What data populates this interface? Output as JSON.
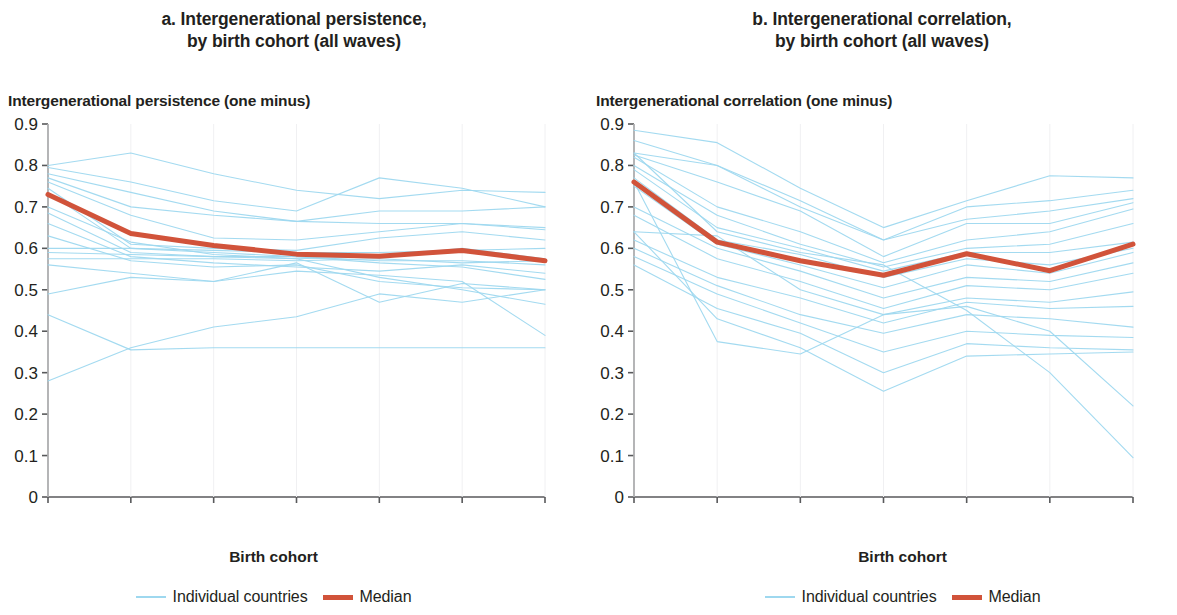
{
  "panels": [
    {
      "key": "a",
      "title": "a. Intergenerational persistence,\nby birth cohort (all waves)",
      "ylabel": "Intergenerational persistence (one minus)",
      "xlabel": "Birth cohort",
      "legend": {
        "individual_label": "Individual countries",
        "median_label": "Median"
      }
    },
    {
      "key": "b",
      "title": "b. Intergenerational correlation,\nby birth cohort (all waves)",
      "ylabel": "Intergenerational correlation (one minus)",
      "xlabel": "Birth cohort",
      "legend": {
        "individual_label": "Individual countries",
        "median_label": "Median"
      }
    }
  ],
  "colors": {
    "individual": "#9ed8ef",
    "median": "#d1533a",
    "axis": "#58595b",
    "text": "#231f20"
  },
  "chart_data": [
    {
      "type": "line",
      "panel": "a",
      "title": "a. Intergenerational persistence, by birth cohort (all waves)",
      "xlabel": "Birth cohort",
      "ylabel": "Intergenerational persistence (one minus)",
      "categories": [
        "1930–39",
        "1940–49",
        "1950–59",
        "1960–69",
        "1970–79",
        "1980–89",
        "1990–99"
      ],
      "yticks": [
        0,
        0.1,
        0.2,
        0.3,
        0.4,
        0.5,
        0.6,
        0.7,
        0.8,
        0.9
      ],
      "ytick_labels": [
        "0",
        "0.1",
        "0.2",
        "0.3",
        "0.4",
        "0.5",
        "0.6",
        "0.7",
        "0.8",
        "0.9"
      ],
      "ylim": [
        0,
        0.9
      ],
      "grid": false,
      "legend_position": "bottom",
      "series": [
        {
          "name": "Median",
          "emphasis": true,
          "color": "#d1533a",
          "values": [
            0.73,
            0.636,
            0.607,
            0.586,
            0.581,
            0.595,
            0.57,
            0.615
          ]
        },
        {
          "name": "Country 1",
          "color": "#9ed8ef",
          "values": [
            0.8,
            0.83,
            0.78,
            0.74,
            0.72,
            0.74,
            0.735,
            0.75
          ]
        },
        {
          "name": "Country 2",
          "color": "#9ed8ef",
          "values": [
            0.795,
            0.76,
            0.715,
            0.69,
            0.77,
            0.745,
            0.7,
            0.76
          ]
        },
        {
          "name": "Country 3",
          "color": "#9ed8ef",
          "values": [
            0.78,
            0.735,
            0.69,
            0.665,
            0.69,
            0.69,
            0.7,
            0.715
          ]
        },
        {
          "name": "Country 4",
          "color": "#9ed8ef",
          "values": [
            0.77,
            0.7,
            0.68,
            0.665,
            0.66,
            0.66,
            0.65,
            0.72
          ]
        },
        {
          "name": "Country 5",
          "color": "#9ed8ef",
          "values": [
            0.76,
            0.68,
            0.625,
            0.62,
            0.64,
            0.66,
            0.645,
            0.665
          ]
        },
        {
          "name": "Country 6",
          "color": "#9ed8ef",
          "values": [
            0.745,
            0.61,
            0.6,
            0.595,
            0.625,
            0.64,
            0.62,
            0.64
          ]
        },
        {
          "name": "Country 7",
          "color": "#9ed8ef",
          "values": [
            0.735,
            0.6,
            0.595,
            0.59,
            0.59,
            0.595,
            0.6,
            0.62
          ]
        },
        {
          "name": "Country 8",
          "color": "#9ed8ef",
          "values": [
            0.7,
            0.615,
            0.585,
            0.575,
            0.58,
            0.6,
            0.575,
            0.6
          ]
        },
        {
          "name": "Country 9",
          "color": "#9ed8ef",
          "values": [
            0.685,
            0.59,
            0.58,
            0.58,
            0.57,
            0.57,
            0.56,
            0.585
          ]
        },
        {
          "name": "Country 10",
          "color": "#9ed8ef",
          "values": [
            0.66,
            0.58,
            0.565,
            0.555,
            0.545,
            0.56,
            0.54,
            0.56
          ]
        },
        {
          "name": "Country 11",
          "color": "#9ed8ef",
          "values": [
            0.63,
            0.57,
            0.555,
            0.56,
            0.52,
            0.505,
            0.5,
            0.515
          ]
        },
        {
          "name": "Country 12",
          "color": "#9ed8ef",
          "values": [
            0.6,
            0.6,
            0.59,
            0.58,
            0.565,
            0.555,
            0.525,
            0.53
          ]
        },
        {
          "name": "Country 13",
          "color": "#9ed8ef",
          "values": [
            0.59,
            0.585,
            0.58,
            0.575,
            0.53,
            0.5,
            0.465,
            0.42
          ]
        },
        {
          "name": "Country 14",
          "color": "#9ed8ef",
          "values": [
            0.575,
            0.575,
            0.575,
            0.57,
            0.575,
            0.565,
            0.57,
            0.575
          ]
        },
        {
          "name": "Country 15",
          "color": "#9ed8ef",
          "values": [
            0.56,
            0.54,
            0.52,
            0.565,
            0.47,
            0.515,
            0.5,
            0.49
          ]
        },
        {
          "name": "Country 16",
          "color": "#9ed8ef",
          "values": [
            0.49,
            0.53,
            0.52,
            0.545,
            0.535,
            0.52,
            0.39,
            0.41
          ]
        },
        {
          "name": "Country 17",
          "color": "#9ed8ef",
          "values": [
            0.44,
            0.355,
            0.36,
            0.36,
            0.36,
            0.36,
            0.36,
            0.36
          ]
        },
        {
          "name": "Country 18",
          "color": "#9ed8ef",
          "values": [
            0.28,
            0.36,
            0.41,
            0.435,
            0.49,
            0.47,
            0.5,
            0.52
          ]
        }
      ]
    },
    {
      "type": "line",
      "panel": "b",
      "title": "b. Intergenerational correlation, by birth cohort (all waves)",
      "xlabel": "Birth cohort",
      "ylabel": "Intergenerational correlation (one minus)",
      "categories": [
        "1930–39",
        "1940–49",
        "1950–59",
        "1960–69",
        "1970–79",
        "1980–89",
        "1990–99"
      ],
      "yticks": [
        0,
        0.1,
        0.2,
        0.3,
        0.4,
        0.5,
        0.6,
        0.7,
        0.8,
        0.9
      ],
      "ytick_labels": [
        "0",
        "0.1",
        "0.2",
        "0.3",
        "0.4",
        "0.5",
        "0.6",
        "0.7",
        "0.8",
        "0.9"
      ],
      "ylim": [
        0,
        0.9
      ],
      "grid": false,
      "legend_position": "bottom",
      "series": [
        {
          "name": "Median",
          "emphasis": true,
          "color": "#d1533a",
          "values": [
            0.76,
            0.615,
            0.57,
            0.535,
            0.587,
            0.546,
            0.61
          ]
        },
        {
          "name": "Country 1",
          "color": "#9ed8ef",
          "values": [
            0.885,
            0.855,
            0.745,
            0.65,
            0.715,
            0.775,
            0.77
          ]
        },
        {
          "name": "Country 2",
          "color": "#9ed8ef",
          "values": [
            0.86,
            0.8,
            0.7,
            0.62,
            0.7,
            0.715,
            0.74
          ]
        },
        {
          "name": "Country 3",
          "color": "#9ed8ef",
          "values": [
            0.83,
            0.8,
            0.715,
            0.62,
            0.67,
            0.69,
            0.72
          ]
        },
        {
          "name": "Country 4",
          "color": "#9ed8ef",
          "values": [
            0.825,
            0.76,
            0.69,
            0.58,
            0.66,
            0.66,
            0.71
          ]
        },
        {
          "name": "Country 5",
          "color": "#9ed8ef",
          "values": [
            0.82,
            0.7,
            0.64,
            0.565,
            0.62,
            0.64,
            0.695
          ]
        },
        {
          "name": "Country 6",
          "color": "#9ed8ef",
          "values": [
            0.8,
            0.68,
            0.61,
            0.555,
            0.6,
            0.61,
            0.66
          ]
        },
        {
          "name": "Country 7",
          "color": "#9ed8ef",
          "values": [
            0.79,
            0.65,
            0.6,
            0.545,
            0.59,
            0.59,
            0.615
          ]
        },
        {
          "name": "Country 8",
          "color": "#9ed8ef",
          "values": [
            0.77,
            0.62,
            0.585,
            0.53,
            0.575,
            0.56,
            0.6
          ]
        },
        {
          "name": "Country 9",
          "color": "#9ed8ef",
          "values": [
            0.75,
            0.61,
            0.56,
            0.505,
            0.56,
            0.54,
            0.59
          ]
        },
        {
          "name": "Country 10",
          "color": "#9ed8ef",
          "values": [
            0.7,
            0.6,
            0.545,
            0.48,
            0.53,
            0.52,
            0.565
          ]
        },
        {
          "name": "Country 11",
          "color": "#9ed8ef",
          "values": [
            0.68,
            0.575,
            0.52,
            0.455,
            0.51,
            0.5,
            0.54
          ]
        },
        {
          "name": "Country 12",
          "color": "#9ed8ef",
          "values": [
            0.64,
            0.63,
            0.5,
            0.44,
            0.48,
            0.47,
            0.495
          ]
        },
        {
          "name": "Country 13",
          "color": "#9ed8ef",
          "values": [
            0.62,
            0.53,
            0.48,
            0.42,
            0.47,
            0.455,
            0.46
          ]
        },
        {
          "name": "Country 14",
          "color": "#9ed8ef",
          "values": [
            0.6,
            0.51,
            0.44,
            0.395,
            0.44,
            0.43,
            0.41
          ]
        },
        {
          "name": "Country 15",
          "color": "#9ed8ef",
          "values": [
            0.58,
            0.49,
            0.42,
            0.35,
            0.4,
            0.39,
            0.385
          ]
        },
        {
          "name": "Country 16",
          "color": "#9ed8ef",
          "values": [
            0.56,
            0.455,
            0.395,
            0.3,
            0.37,
            0.36,
            0.355
          ]
        },
        {
          "name": "Country 17",
          "color": "#9ed8ef",
          "values": [
            0.64,
            0.43,
            0.36,
            0.255,
            0.34,
            0.345,
            0.35
          ]
        },
        {
          "name": "Country 18",
          "color": "#9ed8ef",
          "values": [
            0.76,
            0.375,
            0.345,
            0.44,
            0.46,
            0.4,
            0.22
          ]
        },
        {
          "name": "Country 19",
          "color": "#9ed8ef",
          "values": [
            0.83,
            0.64,
            0.59,
            0.56,
            0.45,
            0.3,
            0.095
          ]
        }
      ]
    }
  ]
}
